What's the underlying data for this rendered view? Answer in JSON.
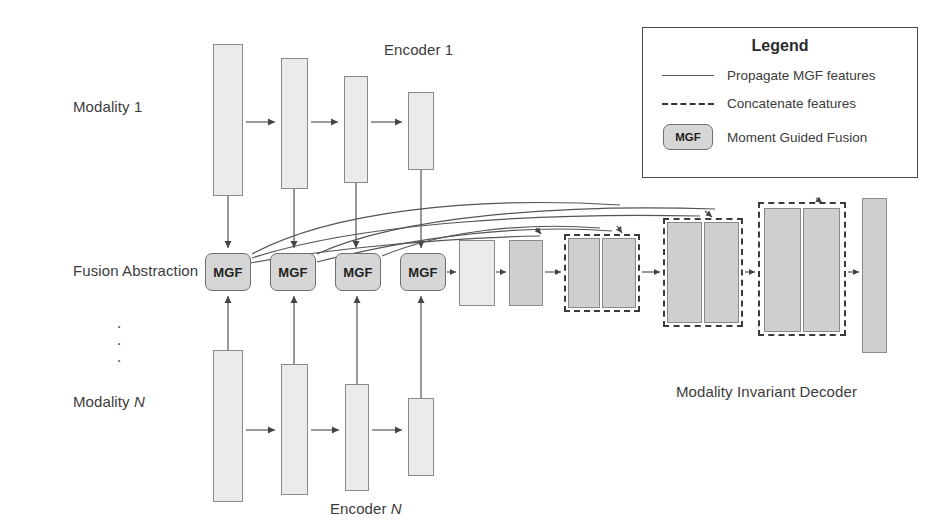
{
  "diagram": {
    "title_labels": {
      "encoder_top": "Encoder 1",
      "encoder_bottom": "Encoder N",
      "modality_top": "Modality 1",
      "modality_bottom": "Modality N",
      "fusion_row": "Fusion Abstraction",
      "decoder": "Modality Invariant Decoder",
      "vertical_dots": "·"
    },
    "mgf_label": "MGF",
    "mgf_blocks": [
      {
        "label": "MGF",
        "x": 205,
        "y": 253,
        "w": 46,
        "h": 38
      },
      {
        "label": "MGF",
        "x": 270,
        "y": 253,
        "w": 46,
        "h": 38
      },
      {
        "label": "MGF",
        "x": 335,
        "y": 253,
        "w": 46,
        "h": 38
      },
      {
        "label": "MGF",
        "x": 400,
        "y": 253,
        "w": 46,
        "h": 38
      }
    ],
    "encoder_top_blocks": [
      {
        "x": 213,
        "y": 44,
        "w": 30,
        "h": 152,
        "tone": "light"
      },
      {
        "x": 281,
        "y": 58,
        "w": 27,
        "h": 131,
        "tone": "light"
      },
      {
        "x": 344,
        "y": 76,
        "w": 24,
        "h": 107,
        "tone": "light"
      },
      {
        "x": 408,
        "y": 92,
        "w": 26,
        "h": 78,
        "tone": "light"
      }
    ],
    "encoder_bottom_blocks": [
      {
        "x": 213,
        "y": 350,
        "w": 30,
        "h": 152,
        "tone": "light"
      },
      {
        "x": 281,
        "y": 364,
        "w": 27,
        "h": 131,
        "tone": "light"
      },
      {
        "x": 345,
        "y": 384,
        "w": 24,
        "h": 107,
        "tone": "light"
      },
      {
        "x": 408,
        "y": 398,
        "w": 26,
        "h": 78,
        "tone": "light"
      }
    ],
    "decoder_blocks": [
      {
        "x": 459,
        "y": 240,
        "w": 36,
        "h": 66,
        "tone": "light"
      },
      {
        "x": 509,
        "y": 240,
        "w": 34,
        "h": 66,
        "tone": "dark"
      },
      {
        "x": 568,
        "y": 238,
        "w": 32,
        "h": 70,
        "tone": "dark"
      },
      {
        "x": 602,
        "y": 238,
        "w": 34,
        "h": 70,
        "tone": "dark"
      },
      {
        "x": 667,
        "y": 222,
        "w": 35,
        "h": 101,
        "tone": "dark"
      },
      {
        "x": 704,
        "y": 222,
        "w": 35,
        "h": 101,
        "tone": "dark"
      },
      {
        "x": 764,
        "y": 208,
        "w": 37,
        "h": 124,
        "tone": "dark"
      },
      {
        "x": 803,
        "y": 208,
        "w": 37,
        "h": 124,
        "tone": "dark"
      },
      {
        "x": 862,
        "y": 198,
        "w": 25,
        "h": 155,
        "tone": "dark"
      }
    ],
    "concat_groups": [
      {
        "x": 564,
        "y": 234,
        "w": 76,
        "h": 78
      },
      {
        "x": 663,
        "y": 218,
        "w": 80,
        "h": 109
      },
      {
        "x": 758,
        "y": 202,
        "w": 88,
        "h": 134
      }
    ]
  },
  "legend": {
    "title": "Legend",
    "box": {
      "x": 642,
      "y": 27,
      "w": 276,
      "h": 151
    },
    "entries": [
      {
        "key": "solid-line",
        "label": "Propagate MGF features"
      },
      {
        "key": "dashed-line",
        "label": "Concatenate features"
      },
      {
        "key": "mgf-chip",
        "chip": "MGF",
        "label": "Moment Guided Fusion"
      }
    ]
  },
  "colors": {
    "block_light": "#ebebeb",
    "block_dark": "#cfcfcf",
    "mgf_fill": "#d6d6d6",
    "stroke": "#555555",
    "dashed": "#333333",
    "text": "#3c3c3c"
  }
}
